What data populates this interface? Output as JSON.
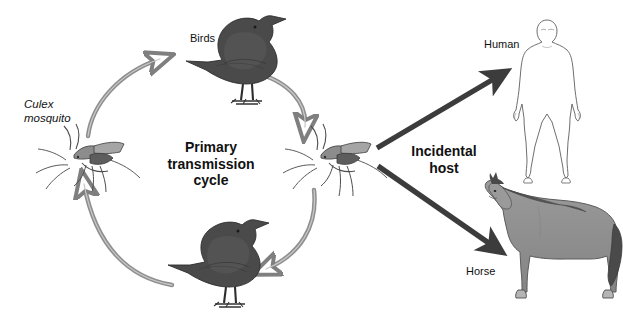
{
  "figure": {
    "title_text": "Primary\ntransmission\ncycle",
    "background_color": "#ffffff",
    "domain": "biology-transmission-cycle-diagram"
  },
  "labels": {
    "birds": "Birds",
    "culex_mosquito": "Culex\nmosquito",
    "primary_cycle": "Primary\ntransmission\ncycle",
    "incidental_host": "Incidental\nhost",
    "human": "Human",
    "horse": "Horse"
  },
  "colors": {
    "cycle_arrow": "#8a8a8a",
    "branch_arrow": "#3c3c3c",
    "bird_body": "#4f4f4f",
    "bird_dark": "#3a3a3a",
    "horse_body": "#8e8e8e",
    "horse_mane": "#4a4a4a",
    "human_outline": "#6f6f6f",
    "human_fill": "#ffffff",
    "mosquito_body": "#9a9a9a",
    "mosquito_dark": "#5d5d5d",
    "text": "#111111"
  },
  "nodes": [
    {
      "id": "culex-mosquito-left",
      "label": "Culex mosquito",
      "role": "vector",
      "x": 55,
      "y": 152
    },
    {
      "id": "bird-top",
      "label": "Birds",
      "role": "amplifying-host",
      "x": 245,
      "y": 55
    },
    {
      "id": "culex-mosquito-right",
      "label": "Culex mosquito",
      "role": "vector",
      "x": 330,
      "y": 152
    },
    {
      "id": "bird-bottom",
      "label": "Birds",
      "role": "amplifying-host",
      "x": 225,
      "y": 260
    },
    {
      "id": "human",
      "label": "Human",
      "role": "incidental-host",
      "x": 547,
      "y": 100
    },
    {
      "id": "horse",
      "label": "Horse",
      "role": "incidental-host",
      "x": 545,
      "y": 245
    }
  ],
  "edges": [
    {
      "id": "edge-mosquito-left-to-bird-top",
      "from": "culex-mosquito-left",
      "to": "bird-top",
      "style": "curved",
      "color": "#8a8a8a"
    },
    {
      "id": "edge-bird-top-to-mosquito-right",
      "from": "bird-top",
      "to": "culex-mosquito-right",
      "style": "curved",
      "color": "#8a8a8a"
    },
    {
      "id": "edge-mosquito-right-to-bird-bottom",
      "from": "culex-mosquito-right",
      "to": "bird-bottom",
      "style": "curved",
      "color": "#8a8a8a"
    },
    {
      "id": "edge-bird-bottom-to-mosquito-left",
      "from": "bird-bottom",
      "to": "culex-mosquito-left",
      "style": "curved",
      "color": "#8a8a8a"
    },
    {
      "id": "edge-mosquito-right-to-human",
      "from": "culex-mosquito-right",
      "to": "human",
      "style": "straight-thick",
      "color": "#3c3c3c"
    },
    {
      "id": "edge-mosquito-right-to-horse",
      "from": "culex-mosquito-right",
      "to": "horse",
      "style": "straight-thick",
      "color": "#3c3c3c"
    }
  ]
}
